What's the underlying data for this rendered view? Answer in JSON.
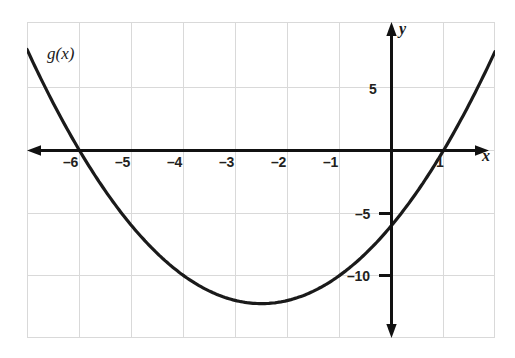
{
  "chart_data": {
    "type": "line",
    "title": "",
    "subtitle": "",
    "xlabel": "x",
    "ylabel": "y",
    "xlim": [
      -7,
      2
    ],
    "ylim": [
      -15.2,
      10.1
    ],
    "grid": true,
    "grid_color": "#d9d9d9",
    "axis_color": "#111111",
    "curve_color": "#1a1a1a",
    "background": "#ffffff",
    "legend_position": "none",
    "annotations": [
      {
        "name": "curve-label",
        "text": "g(x)",
        "x": -6.05,
        "y": 7.4
      }
    ],
    "x_ticks": [
      {
        "value": -6,
        "label": "–6"
      },
      {
        "value": -5,
        "label": "–5"
      },
      {
        "value": -4,
        "label": "–4"
      },
      {
        "value": -3,
        "label": "–3"
      },
      {
        "value": -2,
        "label": "–2"
      },
      {
        "value": -1,
        "label": "–1"
      },
      {
        "value": 1,
        "label": "1"
      }
    ],
    "y_ticks": [
      {
        "value": 5,
        "label": "5"
      },
      {
        "value": -5,
        "label": "–5"
      },
      {
        "value": -10,
        "label": "–10"
      }
    ],
    "x_gridlines": [
      -7,
      -6,
      -5,
      -4,
      -3,
      -2,
      -1,
      0,
      1,
      2
    ],
    "y_gridlines": [
      5,
      0,
      -5,
      -10
    ],
    "series": [
      {
        "name": "g(x)",
        "equation": "g(x) = x^2 + 5x - 6",
        "roots": [
          -6,
          1
        ],
        "y_intercept": -6,
        "vertex": [
          -2.5,
          -12.25
        ],
        "x": [
          -7.0,
          -6.75,
          -6.5,
          -6.25,
          -6.0,
          -5.75,
          -5.5,
          -5.25,
          -5.0,
          -4.75,
          -4.5,
          -4.25,
          -4.0,
          -3.75,
          -3.5,
          -3.25,
          -3.0,
          -2.75,
          -2.5,
          -2.25,
          -2.0,
          -1.75,
          -1.5,
          -1.25,
          -1.0,
          -0.75,
          -0.5,
          -0.25,
          0.0,
          0.25,
          0.5,
          0.75,
          1.0,
          1.25,
          1.5,
          1.75,
          2.0
        ],
        "y": [
          8.0,
          5.5625,
          3.25,
          1.0625,
          -1.0,
          -2.9375,
          -4.75,
          -6.4375,
          -8.0,
          -9.4375,
          -10.75,
          -11.9375,
          -13.0,
          -13.9375,
          -14.75,
          -15.4375,
          -16.0,
          -16.4375,
          -16.75,
          -16.9375,
          -17.0,
          -16.9375,
          -16.75,
          -16.4375,
          -16.0,
          -15.4375,
          -14.75,
          -13.9375,
          -13.0,
          -11.9375,
          -10.75,
          -9.4375,
          -8.0,
          -6.4375,
          -4.75,
          -2.9375,
          -1.0
        ]
      }
    ]
  },
  "axes": {
    "x_axis_name": "x",
    "y_axis_name": "y"
  }
}
